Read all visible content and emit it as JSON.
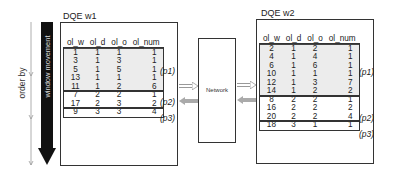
{
  "left_axis": {
    "order_label": "order by",
    "window_label": "window movement"
  },
  "network": {
    "label": "Network"
  },
  "workers": [
    {
      "title": "DQE w1",
      "columns": [
        "ol_w",
        "ol_d",
        "ol_o",
        "ol_num"
      ],
      "partitions": [
        {
          "label": "(p1)",
          "rows": [
            [
              "1",
              "1",
              "1",
              "1"
            ],
            [
              "3",
              "1",
              "3",
              "1"
            ],
            [
              "5",
              "1",
              "5",
              "1"
            ],
            [
              "13",
              "1",
              "1",
              "1"
            ],
            [
              "11",
              "1",
              "2",
              "6"
            ]
          ]
        },
        {
          "label": "(p2)",
          "rows": [
            [
              "7",
              "2",
              "2",
              "1"
            ],
            [
              "17",
              "2",
              "3",
              "2"
            ]
          ]
        },
        {
          "label": "(p3)",
          "rows": [
            [
              "9",
              "3",
              "3",
              "4"
            ]
          ]
        }
      ]
    },
    {
      "title": "DQE w2",
      "columns": [
        "ol_w",
        "ol_d",
        "ol_o",
        "ol_num"
      ],
      "partitions": [
        {
          "label": "(p1)",
          "rows": [
            [
              "2",
              "1",
              "2",
              "1"
            ],
            [
              "4",
              "1",
              "4",
              "1"
            ],
            [
              "6",
              "1",
              "6",
              "1"
            ],
            [
              "10",
              "1",
              "1",
              "1"
            ],
            [
              "12",
              "1",
              "3",
              "7"
            ],
            [
              "14",
              "1",
              "2",
              "2"
            ]
          ]
        },
        {
          "label": "(p2)",
          "rows": [
            [
              "8",
              "2",
              "2",
              "1"
            ],
            [
              "16",
              "2",
              "2",
              "2"
            ],
            [
              "20",
              "2",
              "2",
              "4"
            ]
          ]
        },
        {
          "label": "(p3)",
          "rows": [
            [
              "18",
              "3",
              "1",
              "1"
            ]
          ]
        }
      ]
    }
  ]
}
